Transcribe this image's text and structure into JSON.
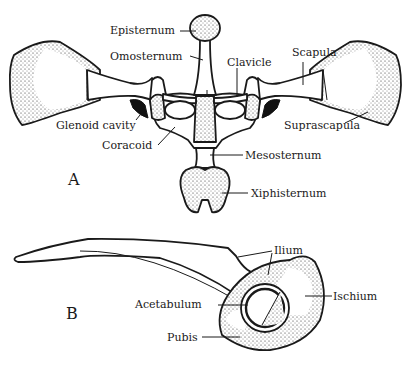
{
  "figure": {
    "panel_a": {
      "letter": "A",
      "labels": {
        "episternum": "Episternum",
        "omosternum": "Omosternum",
        "clavicle": "Clavicle",
        "scapula": "Scapula",
        "glenoid_cavity": "Glenoid cavity",
        "suprascapula": "Suprascapula",
        "coracoid": "Coracoid",
        "mesosternum": "Mesosternum",
        "xiphisternum": "Xiphisternum"
      }
    },
    "panel_b": {
      "letter": "B",
      "labels": {
        "ilium": "Ilium",
        "acetabulum": "Acetabulum",
        "ischium": "Ischium",
        "pubis": "Pubis"
      }
    },
    "colors": {
      "ink": "#1a1a1a",
      "background": "#ffffff"
    }
  }
}
